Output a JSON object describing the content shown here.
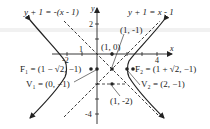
{
  "figure": {
    "type": "hyperbola-graph",
    "equation_center": "(1, -1)",
    "axes": {
      "x_label": "x",
      "y_label": "y"
    },
    "x_ticks": [
      "-2",
      "1",
      "4"
    ],
    "y_ticks": [
      "2",
      "-4"
    ],
    "asymptotes": [
      {
        "label": "y + 1 = -(x - 1)"
      },
      {
        "label": "y + 1 = x - 1"
      }
    ],
    "points": [
      {
        "name": "center",
        "label": "(1, -1)"
      },
      {
        "name": "x-intercept",
        "label": "(1, 0)"
      },
      {
        "name": "lower",
        "label": "(1, -2)"
      },
      {
        "name": "F1",
        "label": "F₁ = (1 − √2, −1)"
      },
      {
        "name": "F2",
        "label": "F₂ = (1 + √2, −1)"
      },
      {
        "name": "V1",
        "label": "V₁ = (0, −1)"
      },
      {
        "name": "V2",
        "label": "V₂ = (2, −1)"
      }
    ],
    "colors": {
      "ink": "#222222",
      "background": "#ffffff"
    }
  }
}
